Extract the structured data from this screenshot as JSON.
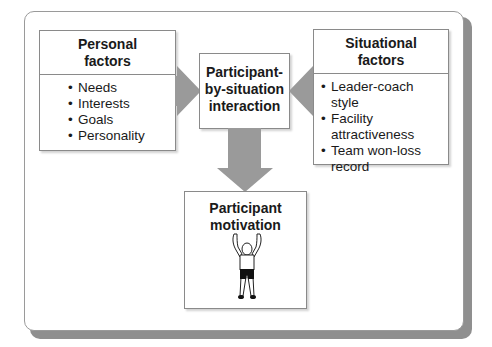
{
  "diagram": {
    "personal_factors": {
      "title": "Personal factors",
      "title_line1": "Personal",
      "title_line2": "factors",
      "items": [
        "Needs",
        "Interests",
        "Goals",
        "Personality"
      ]
    },
    "situational_factors": {
      "title": "Situational factors",
      "title_line1": "Situational",
      "title_line2": "factors",
      "items": [
        "Leader-coach style",
        "Facility attractiveness",
        "Team won-loss record"
      ]
    },
    "interaction": {
      "title": "Participant-by-situation interaction",
      "line1": "Participant-",
      "line2": "by-situation",
      "line3": "interaction"
    },
    "outcome": {
      "title": "Participant motivation",
      "line1": "Participant",
      "line2": "motivation",
      "illustration": "person-arms-raised-icon"
    },
    "arrows": [
      {
        "from": "Personal factors",
        "to": "Participant-by-situation interaction"
      },
      {
        "from": "Situational factors",
        "to": "Participant-by-situation interaction"
      },
      {
        "from": "Participant-by-situation interaction",
        "to": "Participant motivation"
      }
    ],
    "colors": {
      "arrow": "#9a9a9a",
      "frame_shadow": "#8f8f8f",
      "border": "#8a8a8a",
      "text": "#1a1a1a"
    }
  }
}
